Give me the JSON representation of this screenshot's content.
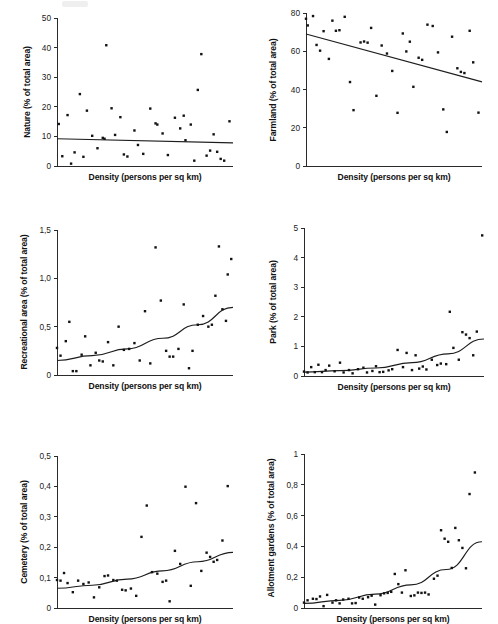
{
  "figure": {
    "title": "",
    "panel_count": 6,
    "shared_xlabel": "Density (persons per sq km)",
    "point_color": "#121212",
    "line_color": "#1d1d1d",
    "axis_color": "#2a2a2a"
  },
  "chart_data": [
    {
      "type": "scatter",
      "id": "nature",
      "title": "",
      "xlabel": "Density (persons per sq km)",
      "ylabel": "Nature (% of total area)",
      "xlim": [
        0,
        100
      ],
      "ylim": [
        0,
        50
      ],
      "yticks": [
        0,
        10,
        20,
        30,
        40,
        50
      ],
      "ytick_labels": [
        "0",
        "10",
        "20",
        "30",
        "40",
        "50"
      ],
      "xticks": [],
      "xtick_labels": [],
      "grid": false,
      "legend": "none",
      "trend": {
        "kind": "linear",
        "x": [
          0,
          100
        ],
        "y": [
          9.2,
          7.8
        ]
      },
      "points": [
        [
          1,
          14.2
        ],
        [
          3,
          3.3
        ],
        [
          6,
          17.2
        ],
        [
          8,
          0.8
        ],
        [
          10,
          4.6
        ],
        [
          13,
          24.3
        ],
        [
          15,
          3.1
        ],
        [
          17,
          18.7
        ],
        [
          20,
          10.2
        ],
        [
          23,
          6.0
        ],
        [
          26,
          9.5
        ],
        [
          27,
          9.2
        ],
        [
          28,
          40.8
        ],
        [
          31,
          19.5
        ],
        [
          33,
          10.5
        ],
        [
          36,
          16.5
        ],
        [
          38,
          3.9
        ],
        [
          40,
          3.2
        ],
        [
          44,
          12.0
        ],
        [
          46,
          7.1
        ],
        [
          49,
          4.1
        ],
        [
          53,
          19.4
        ],
        [
          56,
          14.4
        ],
        [
          57,
          14.0
        ],
        [
          60,
          11.0
        ],
        [
          63,
          3.7
        ],
        [
          67,
          16.3
        ],
        [
          70,
          12.7
        ],
        [
          72,
          17.0
        ],
        [
          73,
          8.7
        ],
        [
          76,
          14.0
        ],
        [
          78,
          1.8
        ],
        [
          80,
          25.7
        ],
        [
          82,
          37.8
        ],
        [
          85,
          3.5
        ],
        [
          87,
          5.2
        ],
        [
          89,
          10.7
        ],
        [
          91,
          4.8
        ],
        [
          93,
          2.4
        ],
        [
          95,
          1.8
        ],
        [
          98,
          15.1
        ]
      ]
    },
    {
      "type": "scatter",
      "id": "farmland",
      "title": "",
      "xlabel": "Density (persons per sq km)",
      "ylabel": "Farmland (% of total area)",
      "xlim": [
        0,
        100
      ],
      "ylim": [
        0,
        80
      ],
      "yticks": [
        0,
        20,
        40,
        60,
        80
      ],
      "ytick_labels": [
        "0",
        "20",
        "40",
        "60",
        "80"
      ],
      "xticks": [],
      "xtick_labels": [],
      "grid": false,
      "legend": "none",
      "trend": {
        "kind": "linear",
        "x": [
          0,
          100
        ],
        "y": [
          69,
          44
        ]
      },
      "points": [
        [
          0,
          77
        ],
        [
          1,
          73.5
        ],
        [
          4,
          78.4
        ],
        [
          6,
          63.3
        ],
        [
          8,
          60.3
        ],
        [
          10,
          70.5
        ],
        [
          13,
          56
        ],
        [
          15,
          76
        ],
        [
          17,
          70.7
        ],
        [
          19,
          71
        ],
        [
          22,
          78
        ],
        [
          25,
          43.9
        ],
        [
          27,
          29.2
        ],
        [
          31,
          64.6
        ],
        [
          33,
          65.1
        ],
        [
          35,
          64.5
        ],
        [
          37,
          72.2
        ],
        [
          40,
          36.7
        ],
        [
          43,
          63
        ],
        [
          46,
          58.8
        ],
        [
          49,
          49.7
        ],
        [
          52,
          27.8
        ],
        [
          55,
          69.3
        ],
        [
          57,
          59.9
        ],
        [
          59,
          65
        ],
        [
          61,
          41.4
        ],
        [
          64,
          56.6
        ],
        [
          66,
          55.5
        ],
        [
          69,
          73.9
        ],
        [
          72,
          73.2
        ],
        [
          75,
          59.4
        ],
        [
          78,
          29.6
        ],
        [
          80,
          17.8
        ],
        [
          83,
          67.6
        ],
        [
          86,
          51.1
        ],
        [
          88,
          49.2
        ],
        [
          90,
          48.6
        ],
        [
          93,
          70.7
        ],
        [
          95,
          54.2
        ],
        [
          98,
          27.9
        ]
      ]
    },
    {
      "type": "scatter",
      "id": "recreational-area",
      "title": "",
      "xlabel": "Density (persons per sq km)",
      "ylabel": "Recreational area (% of total area)",
      "xlim": [
        0,
        100
      ],
      "ylim": [
        0,
        1.5
      ],
      "yticks": [
        0,
        0.5,
        1.0,
        1.5
      ],
      "ytick_labels": [
        "0",
        "0,5",
        "1,0",
        "1,5"
      ],
      "xticks": [],
      "xtick_labels": [],
      "grid": false,
      "legend": "none",
      "trend": {
        "kind": "exponential",
        "x": [
          0,
          20,
          40,
          60,
          80,
          100
        ],
        "y": [
          0.15,
          0.2,
          0.27,
          0.38,
          0.52,
          0.7
        ]
      },
      "points": [
        [
          0,
          0.28
        ],
        [
          2,
          0.2
        ],
        [
          5,
          0.35
        ],
        [
          7,
          0.55
        ],
        [
          9,
          0.04
        ],
        [
          11,
          0.04
        ],
        [
          14,
          0.21
        ],
        [
          16,
          0.4
        ],
        [
          19,
          0.1
        ],
        [
          22,
          0.23
        ],
        [
          24,
          0.15
        ],
        [
          26,
          0.14
        ],
        [
          29,
          0.34
        ],
        [
          32,
          0.1
        ],
        [
          35,
          0.5
        ],
        [
          38,
          0.26
        ],
        [
          41,
          0.27
        ],
        [
          44,
          0.33
        ],
        [
          47,
          0.15
        ],
        [
          50,
          0.66
        ],
        [
          53,
          0.12
        ],
        [
          56,
          1.32
        ],
        [
          59,
          0.77
        ],
        [
          62,
          0.25
        ],
        [
          64,
          0.19
        ],
        [
          66,
          0.19
        ],
        [
          69,
          0.27
        ],
        [
          72,
          0.73
        ],
        [
          75,
          0.07
        ],
        [
          77,
          0.25
        ],
        [
          80,
          0.52
        ],
        [
          83,
          0.61
        ],
        [
          86,
          0.5
        ],
        [
          88,
          0.52
        ],
        [
          90,
          0.82
        ],
        [
          92,
          1.33
        ],
        [
          94,
          0.68
        ],
        [
          96,
          0.56
        ],
        [
          97,
          1.04
        ],
        [
          99,
          1.2
        ]
      ]
    },
    {
      "type": "scatter",
      "id": "park",
      "title": "",
      "xlabel": "Density (persons per sq km)",
      "ylabel": "Park (% of total area)",
      "xlim": [
        0,
        100
      ],
      "ylim": [
        0,
        5
      ],
      "yticks": [
        0,
        1,
        2,
        3,
        4,
        5
      ],
      "ytick_labels": [
        "0",
        "1",
        "2",
        "3",
        "4",
        "5"
      ],
      "xticks": [],
      "xtick_labels": [],
      "grid": false,
      "legend": "none",
      "trend": {
        "kind": "exponential",
        "x": [
          0,
          20,
          40,
          60,
          80,
          100
        ],
        "y": [
          0.13,
          0.18,
          0.27,
          0.45,
          0.75,
          1.25
        ]
      },
      "points": [
        [
          0,
          0.15
        ],
        [
          2,
          0.12
        ],
        [
          4,
          0.3
        ],
        [
          6,
          0.13
        ],
        [
          8,
          0.38
        ],
        [
          10,
          0.13
        ],
        [
          12,
          0.2
        ],
        [
          14,
          0.35
        ],
        [
          17,
          0.16
        ],
        [
          20,
          0.45
        ],
        [
          22,
          0.12
        ],
        [
          25,
          0.2
        ],
        [
          27,
          0.09
        ],
        [
          30,
          0.23
        ],
        [
          33,
          0.28
        ],
        [
          35,
          0.12
        ],
        [
          38,
          0.17
        ],
        [
          40,
          0.33
        ],
        [
          42,
          0.13
        ],
        [
          44,
          0.14
        ],
        [
          47,
          0.19
        ],
        [
          49,
          0.23
        ],
        [
          52,
          0.88
        ],
        [
          55,
          0.3
        ],
        [
          57,
          0.78
        ],
        [
          60,
          0.2
        ],
        [
          62,
          0.7
        ],
        [
          64,
          0.25
        ],
        [
          66,
          0.32
        ],
        [
          68,
          0.22
        ],
        [
          71,
          0.55
        ],
        [
          74,
          0.37
        ],
        [
          76,
          0.42
        ],
        [
          79,
          0.4
        ],
        [
          81,
          2.17
        ],
        [
          83,
          0.95
        ],
        [
          86,
          0.55
        ],
        [
          88,
          1.48
        ],
        [
          90,
          1.4
        ],
        [
          92,
          1.28
        ],
        [
          94,
          0.7
        ],
        [
          96,
          1.5
        ],
        [
          99,
          4.75
        ]
      ]
    },
    {
      "type": "scatter",
      "id": "cemetery",
      "title": "",
      "xlabel": "Density (persons per sq km)",
      "ylabel": "Cemetery (% of total area)",
      "xlim": [
        0,
        100
      ],
      "ylim": [
        0,
        0.5
      ],
      "yticks": [
        0,
        0.1,
        0.2,
        0.3,
        0.4,
        0.5
      ],
      "ytick_labels": [
        "0",
        "0,1",
        "0,2",
        "0,3",
        "0,4",
        "0,5"
      ],
      "xticks": [],
      "xtick_labels": [],
      "grid": false,
      "legend": "none",
      "trend": {
        "kind": "exponential",
        "x": [
          0,
          20,
          40,
          60,
          80,
          100
        ],
        "y": [
          0.065,
          0.075,
          0.095,
          0.122,
          0.152,
          0.183
        ]
      },
      "points": [
        [
          0,
          0.092
        ],
        [
          2,
          0.09
        ],
        [
          4,
          0.115
        ],
        [
          6,
          0.082
        ],
        [
          9,
          0.052
        ],
        [
          12,
          0.09
        ],
        [
          15,
          0.079
        ],
        [
          18,
          0.084
        ],
        [
          21,
          0.035
        ],
        [
          24,
          0.068
        ],
        [
          27,
          0.105
        ],
        [
          29,
          0.107
        ],
        [
          32,
          0.092
        ],
        [
          34,
          0.09
        ],
        [
          37,
          0.06
        ],
        [
          39,
          0.058
        ],
        [
          42,
          0.064
        ],
        [
          45,
          0.04
        ],
        [
          48,
          0.234
        ],
        [
          51,
          0.337
        ],
        [
          54,
          0.118
        ],
        [
          57,
          0.113
        ],
        [
          60,
          0.086
        ],
        [
          62,
          0.09
        ],
        [
          64,
          0.022
        ],
        [
          67,
          0.188
        ],
        [
          70,
          0.145
        ],
        [
          73,
          0.399
        ],
        [
          76,
          0.073
        ],
        [
          79,
          0.345
        ],
        [
          82,
          0.122
        ],
        [
          85,
          0.182
        ],
        [
          87,
          0.168
        ],
        [
          89,
          0.152
        ],
        [
          91,
          0.158
        ],
        [
          94,
          0.222
        ],
        [
          97,
          0.401
        ]
      ]
    },
    {
      "type": "scatter",
      "id": "allotment-gardens",
      "title": "",
      "xlabel": "Density (persons per sq km)",
      "ylabel": "Allotment gardens (% of total area)",
      "xlim": [
        0,
        100
      ],
      "ylim": [
        0,
        1
      ],
      "yticks": [
        0,
        0.2,
        0.4,
        0.6,
        0.8,
        1
      ],
      "ytick_labels": [
        "0",
        "0,2",
        "0,4",
        "0,6",
        "0,8",
        "1"
      ],
      "xticks": [],
      "xtick_labels": [],
      "grid": false,
      "legend": "none",
      "trend": {
        "kind": "exponential",
        "x": [
          0,
          20,
          40,
          60,
          80,
          100
        ],
        "y": [
          0.03,
          0.05,
          0.09,
          0.15,
          0.25,
          0.43
        ]
      },
      "points": [
        [
          0,
          0.035
        ],
        [
          2,
          0.05
        ],
        [
          5,
          0.06
        ],
        [
          7,
          0.058
        ],
        [
          9,
          0.075
        ],
        [
          11,
          0.012
        ],
        [
          13,
          0.085
        ],
        [
          16,
          0.035
        ],
        [
          18,
          0.05
        ],
        [
          20,
          0.03
        ],
        [
          22,
          0.055
        ],
        [
          25,
          0.06
        ],
        [
          27,
          0.03
        ],
        [
          29,
          0.032
        ],
        [
          31,
          0.068
        ],
        [
          33,
          0.06
        ],
        [
          36,
          0.07
        ],
        [
          38,
          0.08
        ],
        [
          40,
          0.022
        ],
        [
          43,
          0.083
        ],
        [
          45,
          0.095
        ],
        [
          47,
          0.098
        ],
        [
          49,
          0.105
        ],
        [
          51,
          0.221
        ],
        [
          53,
          0.155
        ],
        [
          55,
          0.1
        ],
        [
          57,
          0.245
        ],
        [
          60,
          0.078
        ],
        [
          62,
          0.082
        ],
        [
          64,
          0.1
        ],
        [
          66,
          0.098
        ],
        [
          68,
          0.1
        ],
        [
          70,
          0.088
        ],
        [
          73,
          0.19
        ],
        [
          75,
          0.21
        ],
        [
          77,
          0.505
        ],
        [
          79,
          0.45
        ],
        [
          81,
          0.43
        ],
        [
          83,
          0.26
        ],
        [
          85,
          0.52
        ],
        [
          87,
          0.44
        ],
        [
          89,
          0.39
        ],
        [
          91,
          0.258
        ],
        [
          93,
          0.74
        ],
        [
          96,
          0.88
        ]
      ]
    }
  ]
}
